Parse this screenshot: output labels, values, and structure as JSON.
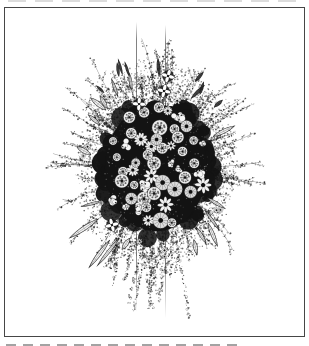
{
  "page": {
    "background_color": "#ffffff"
  },
  "artwork": {
    "alt": "Black-and-white pen-and-ink engraving of a round flower bouquet: a dense dark core of small rosette and daisy flowers surrounded by wispy stippled sprays radiating outward, trailing dotted vines hanging below, and two thin vertical stems, all inside a thin rectangular frame on white paper",
    "ink_color": "#1c1c1c",
    "paper_color": "#ffffff",
    "frame": {
      "left": 4,
      "top": 7,
      "width": 301,
      "height": 330,
      "line_color": "#464646",
      "line_width": 1.2
    },
    "top_edge_artifact": {
      "color": "#bfbfbf",
      "top": 0,
      "left": 8,
      "width": 294,
      "height": 2,
      "dash": 18,
      "gap": 9,
      "opacity": 0.55
    },
    "caption_remnant": {
      "color": "#8c8c8c",
      "top": 344,
      "left": 6,
      "width": 232,
      "height": 2,
      "dash": 10,
      "gap": 7,
      "opacity": 0.8
    },
    "bouquet": {
      "seed": 11,
      "center_x": 156,
      "center_y": 168,
      "core_rx": 58,
      "core_ry": 72,
      "tip_rx": 112,
      "tip_ry_up": 148,
      "tip_ry_down": 118,
      "spray_count": 66,
      "hanging_count": 30,
      "speckle_count": 2300,
      "upper_foliage_count": 650,
      "core_blob_count": 120,
      "core_texture_count": 320,
      "leaf_count": 14,
      "droop_leaf_count": 3,
      "dark_leaf_count": 9,
      "flower_count": 50,
      "mini_flower_count": 18,
      "cross_flowers": [
        [
          168,
          76
        ],
        [
          164,
          91
        ],
        [
          139,
          104
        ],
        [
          112,
          225
        ]
      ],
      "stems": [
        {
          "x": 136.5,
          "y_top": 22,
          "y_bottom": 312
        },
        {
          "x": 165.5,
          "y_top": 25,
          "y_bottom": 318
        }
      ],
      "stem_color": "#3c3c3c"
    }
  }
}
